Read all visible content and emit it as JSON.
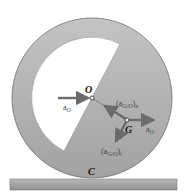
{
  "diagram": {
    "colors": {
      "disk": "#a9a9a9",
      "disk_edge": "#6e6e6e",
      "cutout": "#ffffff",
      "ground": "#a5a5a5",
      "ground_edge": "#7a7a7a",
      "arrow": "#6b6b6b"
    },
    "points": {
      "O": "O",
      "G": "G",
      "C": "C"
    },
    "vectors": {
      "aO_at_O": {
        "label": "a",
        "sub": "O"
      },
      "aO_at_G": {
        "label": "a",
        "sub": "O"
      },
      "aGO_n": {
        "label": "(a",
        "sub": "G/O",
        "tail": ")",
        "tail_sub": "n"
      },
      "aGO_t": {
        "label": "(a",
        "sub": "G/O",
        "tail": ")",
        "tail_sub": "t"
      }
    }
  }
}
